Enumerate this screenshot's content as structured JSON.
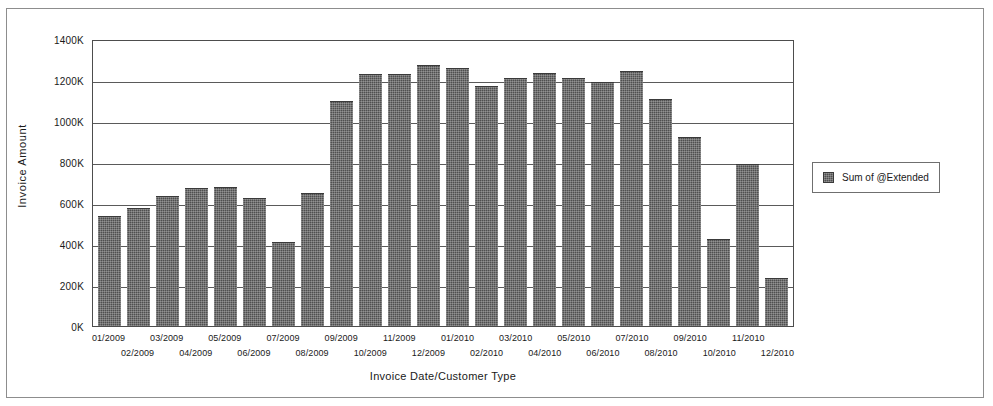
{
  "chart_data": {
    "type": "bar",
    "title": "",
    "xlabel": "Invoice Date/Customer Type",
    "ylabel": "Invoice Amount",
    "ylim": [
      0,
      1400000
    ],
    "ytick_labels": [
      "1400K",
      "1200K",
      "1000K",
      "800K",
      "600K",
      "400K",
      "200K",
      "0K"
    ],
    "ytick_values": [
      1400000,
      1200000,
      1000000,
      800000,
      600000,
      400000,
      200000,
      0
    ],
    "grid": true,
    "legend_position": "right",
    "series": [
      {
        "name": "Sum of @Extended",
        "color": "#4f4f4f",
        "values": [
          535000,
          575000,
          635000,
          672000,
          678000,
          625000,
          408000,
          648000,
          1100000,
          1228000,
          1228000,
          1272000,
          1258000,
          1172000,
          1212000,
          1232000,
          1208000,
          1192000,
          1245000,
          1108000,
          922000,
          425000,
          790000,
          235000
        ]
      }
    ],
    "categories": [
      "01/2009",
      "02/2009",
      "03/2009",
      "04/2009",
      "05/2009",
      "06/2009",
      "07/2009",
      "08/2009",
      "09/2009",
      "10/2009",
      "11/2009",
      "12/2009",
      "01/2010",
      "02/2010",
      "03/2010",
      "04/2010",
      "05/2010",
      "06/2010",
      "07/2010",
      "08/2010",
      "09/2010",
      "10/2010",
      "11/2010",
      "12/2010"
    ]
  },
  "legend": {
    "entries": [
      {
        "label": "Sum of @Extended",
        "color": "#4f4f4f"
      }
    ]
  }
}
